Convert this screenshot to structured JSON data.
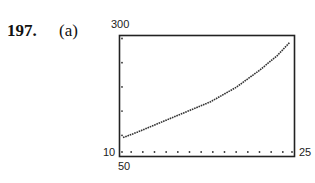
{
  "header": {
    "problem_number": "197.",
    "part_label": "(a)"
  },
  "window_labels": {
    "ymax": "300",
    "ymin": "50",
    "xmin": "10",
    "xmax": "25"
  },
  "chart_data": {
    "type": "line",
    "title": "",
    "xlabel": "",
    "ylabel": "",
    "xlim": [
      10,
      25
    ],
    "ylim": [
      50,
      300
    ],
    "grid": false,
    "x_tick_marks": "dotted, every 1 unit along bottom",
    "y_tick_marks": "dotted, every 50 units along left",
    "series": [
      {
        "name": "curve",
        "style": "dotted graphing-calculator trace, increasing and concave up",
        "x": [
          10.3,
          11.5,
          13.5,
          15.5,
          17.8,
          20.0,
          22.0,
          23.5,
          24.6
        ],
        "y": [
          89,
          100,
          120,
          140,
          163,
          193,
          228,
          258,
          286
        ]
      }
    ]
  }
}
